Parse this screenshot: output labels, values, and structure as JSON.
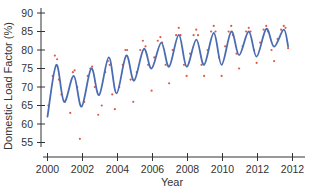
{
  "chart_data": {
    "type": "line",
    "title": "",
    "xlabel": "Year",
    "ylabel": "Domestic Load Factor (%)",
    "xlim": [
      2000,
      2014
    ],
    "ylim": [
      53,
      91
    ],
    "grid": false,
    "legend": null,
    "x_ticks": [
      2000,
      2002,
      2004,
      2006,
      2008,
      2010,
      2012,
      2014
    ],
    "x_tick_labels": [
      "2000",
      "2002",
      "2004",
      "2006",
      "2008",
      "2010",
      "2012",
      "2012"
    ],
    "y_ticks": [
      55,
      60,
      65,
      70,
      75,
      80,
      85,
      90
    ],
    "y_tick_labels": [
      "55",
      "60",
      "65",
      "70",
      "75",
      "80",
      "85",
      "90"
    ],
    "colors": {
      "curve": "#4a6cb3",
      "points": "#e05a48",
      "axis": "#333333"
    },
    "series": [
      {
        "name": "Smoothed seasonal fit",
        "kind": "line",
        "x": [
          2000.0,
          2000.5,
          2000.95,
          2001.5,
          2001.95,
          2002.5,
          2002.95,
          2003.5,
          2003.95,
          2004.5,
          2004.95,
          2005.5,
          2005.95,
          2006.5,
          2006.95,
          2007.5,
          2007.95,
          2008.5,
          2008.95,
          2009.5,
          2009.95,
          2010.5,
          2010.95,
          2011.5,
          2011.95,
          2012.5,
          2012.95,
          2013.5,
          2013.75
        ],
        "values": [
          62,
          76,
          66,
          73,
          64.7,
          75,
          67.8,
          78,
          68.3,
          78.5,
          71.7,
          80.3,
          75,
          82,
          75.5,
          84.1,
          75.5,
          82.8,
          76,
          84.6,
          76,
          85,
          78.6,
          85,
          78.2,
          85.7,
          80.9,
          85.5,
          81
        ]
      },
      {
        "name": "Monthly observations",
        "kind": "scatter",
        "x": [
          2000.05,
          2000.3,
          2000.42,
          2000.55,
          2000.65,
          2000.8,
          2001.0,
          2001.3,
          2001.45,
          2001.55,
          2001.7,
          2001.85,
          2002.1,
          2002.3,
          2002.45,
          2002.55,
          2002.7,
          2002.9,
          2003.1,
          2003.3,
          2003.45,
          2003.55,
          2003.7,
          2003.85,
          2004.1,
          2004.3,
          2004.45,
          2004.55,
          2004.75,
          2004.9,
          2005.1,
          2005.3,
          2005.45,
          2005.6,
          2005.75,
          2005.95,
          2006.1,
          2006.3,
          2006.45,
          2006.55,
          2006.75,
          2006.95,
          2007.15,
          2007.35,
          2007.5,
          2007.6,
          2007.8,
          2007.95,
          2008.15,
          2008.35,
          2008.5,
          2008.6,
          2008.8,
          2008.95,
          2009.15,
          2009.35,
          2009.5,
          2009.6,
          2009.8,
          2009.95,
          2010.15,
          2010.35,
          2010.5,
          2010.6,
          2010.8,
          2010.95,
          2011.15,
          2011.35,
          2011.5,
          2011.6,
          2011.8,
          2011.95,
          2012.15,
          2012.35,
          2012.5,
          2012.6,
          2012.8,
          2012.95,
          2013.15,
          2013.35,
          2013.5,
          2013.6,
          2013.75
        ],
        "values": [
          65,
          73,
          78.5,
          77.5,
          72,
          68,
          66,
          63,
          74,
          74.5,
          70,
          56,
          66,
          73,
          75,
          75.5,
          70,
          62.5,
          65,
          74,
          77,
          76,
          68,
          64,
          70,
          76,
          80,
          80,
          72,
          66,
          74,
          80,
          82.5,
          81,
          76,
          69,
          78,
          82.5,
          83.5,
          82,
          76,
          71,
          80,
          84,
          86,
          84,
          76,
          73,
          79,
          84,
          85.5,
          84,
          76,
          73,
          80,
          85,
          86.5,
          85,
          78,
          73,
          81,
          85,
          86.5,
          84,
          79,
          75,
          81,
          85,
          86,
          85,
          80,
          76.5,
          82,
          85.5,
          86.5,
          85,
          80,
          77,
          83,
          85.5,
          86.5,
          86,
          80.5
        ]
      }
    ]
  }
}
